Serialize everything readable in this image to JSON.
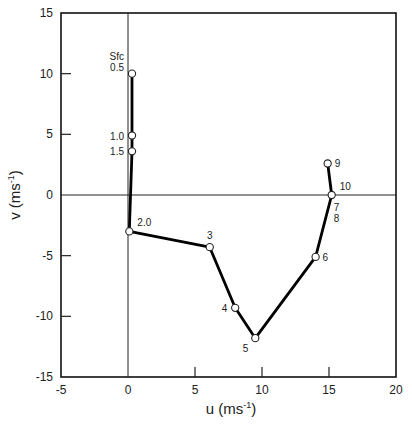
{
  "chart_data": {
    "type": "line",
    "title": "",
    "xlabel": "u (ms",
    "xlabel_sup": "-1",
    "xlabel_end": ")",
    "ylabel": "v (ms",
    "ylabel_sup": "-1",
    "ylabel_end": ")",
    "xlim": [
      -5,
      20
    ],
    "ylim": [
      -15,
      15
    ],
    "xticks": [
      -5,
      0,
      5,
      10,
      15,
      20
    ],
    "yticks": [
      -15,
      -10,
      -5,
      0,
      5,
      10,
      15
    ],
    "zero_lines": true,
    "grid": false,
    "series": [
      {
        "name": "hodograph",
        "points": [
          {
            "u": 0.3,
            "v": 10.0,
            "labels": [
              "Sfc",
              "0.5"
            ],
            "label_pos": "left"
          },
          {
            "u": 0.3,
            "v": 4.9,
            "labels": [
              "1.0"
            ],
            "label_pos": "left"
          },
          {
            "u": 0.3,
            "v": 3.6,
            "labels": [
              "1.5"
            ],
            "label_pos": "left"
          },
          {
            "u": 0.1,
            "v": -3.0,
            "labels": [
              "2.0"
            ],
            "label_pos": "upper-right"
          },
          {
            "u": 6.1,
            "v": -4.3,
            "labels": [
              "3"
            ],
            "label_pos": "above"
          },
          {
            "u": 8.0,
            "v": -9.3,
            "labels": [
              "4"
            ],
            "label_pos": "left"
          },
          {
            "u": 9.5,
            "v": -11.8,
            "labels": [
              "5"
            ],
            "label_pos": "lower-left"
          },
          {
            "u": 14.0,
            "v": -5.1,
            "labels": [
              "6"
            ],
            "label_pos": "right"
          },
          {
            "u": 15.2,
            "v": 0.0,
            "labels": [
              "7",
              "8"
            ],
            "label_pos": "lower-right"
          },
          {
            "u": 14.9,
            "v": 2.6,
            "labels": [
              "9"
            ],
            "label_pos": "right"
          }
        ],
        "extra_labels": [
          {
            "u": 15.2,
            "v": 0.0,
            "text": "10",
            "label_pos": "upper-right"
          }
        ]
      }
    ]
  }
}
